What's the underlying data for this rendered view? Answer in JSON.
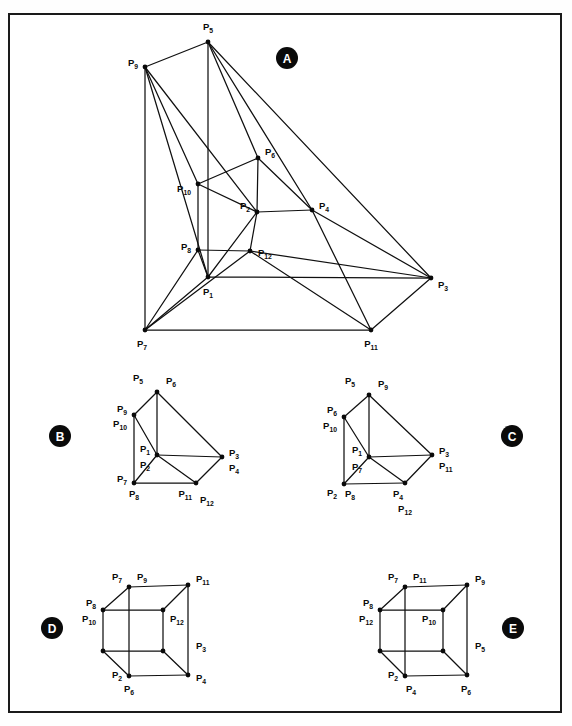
{
  "figure": {
    "title": "",
    "border_color": "#1a1a1a",
    "line_color": "#101010",
    "node_color": "#0a0a0a",
    "panel_badge_bg": "#0a0a0a",
    "panel_badge_fg": "#ffffff"
  },
  "panels": [
    {
      "id": "A",
      "label": "A",
      "cx": 287,
      "cy": 58,
      "r": 11
    },
    {
      "id": "B",
      "label": "B",
      "cx": 60,
      "cy": 436,
      "r": 11
    },
    {
      "id": "C",
      "label": "C",
      "cx": 512,
      "cy": 436,
      "r": 11
    },
    {
      "id": "D",
      "label": "D",
      "cx": 52,
      "cy": 628,
      "r": 11
    },
    {
      "id": "E",
      "label": "E",
      "cx": 513,
      "cy": 628,
      "r": 11
    }
  ],
  "vertex_prefix": "P",
  "panel_a": {
    "nodes": [
      {
        "id": "P1",
        "sub": "1",
        "x": 208,
        "y": 277,
        "lx": 208,
        "ly": 295,
        "anchor": "middle"
      },
      {
        "id": "P2",
        "sub": "2",
        "x": 257,
        "y": 212,
        "lx": 250,
        "ly": 209,
        "anchor": "end"
      },
      {
        "id": "P3",
        "sub": "3",
        "x": 431,
        "y": 278,
        "lx": 438,
        "ly": 288,
        "anchor": "start"
      },
      {
        "id": "P4",
        "sub": "4",
        "x": 312,
        "y": 210,
        "lx": 319,
        "ly": 209,
        "anchor": "start"
      },
      {
        "id": "P5",
        "sub": "5",
        "x": 208,
        "y": 42,
        "lx": 208,
        "ly": 30,
        "anchor": "middle"
      },
      {
        "id": "P6",
        "sub": "6",
        "x": 258,
        "y": 158,
        "lx": 265,
        "ly": 155,
        "anchor": "start"
      },
      {
        "id": "P7",
        "sub": "7",
        "x": 145,
        "y": 330,
        "lx": 142,
        "ly": 347,
        "anchor": "middle"
      },
      {
        "id": "P8",
        "sub": "8",
        "x": 198,
        "y": 250,
        "lx": 191,
        "ly": 250,
        "anchor": "end"
      },
      {
        "id": "P9",
        "sub": "9",
        "x": 145,
        "y": 67,
        "lx": 138,
        "ly": 66,
        "anchor": "end"
      },
      {
        "id": "P10",
        "sub": "10",
        "x": 198,
        "y": 184,
        "lx": 191,
        "ly": 192,
        "anchor": "end"
      },
      {
        "id": "P11",
        "sub": "11",
        "x": 371,
        "y": 330,
        "lx": 371,
        "ly": 347,
        "anchor": "middle"
      },
      {
        "id": "P12",
        "sub": "12",
        "x": 250,
        "y": 251,
        "lx": 258,
        "ly": 256,
        "anchor": "start"
      }
    ],
    "edges": [
      [
        "P5",
        "P9"
      ],
      [
        "P5",
        "P1"
      ],
      [
        "P5",
        "P6"
      ],
      [
        "P5",
        "P4"
      ],
      [
        "P5",
        "P3"
      ],
      [
        "P9",
        "P7"
      ],
      [
        "P9",
        "P10"
      ],
      [
        "P9",
        "P2"
      ],
      [
        "P9",
        "P1"
      ],
      [
        "P10",
        "P6"
      ],
      [
        "P10",
        "P8"
      ],
      [
        "P10",
        "P2"
      ],
      [
        "P6",
        "P2"
      ],
      [
        "P6",
        "P4"
      ],
      [
        "P2",
        "P4"
      ],
      [
        "P2",
        "P12"
      ],
      [
        "P2",
        "P1"
      ],
      [
        "P8",
        "P12"
      ],
      [
        "P8",
        "P7"
      ],
      [
        "P8",
        "P1"
      ],
      [
        "P1",
        "P3"
      ],
      [
        "P1",
        "P7"
      ],
      [
        "P12",
        "P3"
      ],
      [
        "P12",
        "P11"
      ],
      [
        "P4",
        "P3"
      ],
      [
        "P4",
        "P11"
      ],
      [
        "P7",
        "P11"
      ],
      [
        "P7",
        "P12"
      ],
      [
        "P11",
        "P3"
      ]
    ]
  },
  "panel_b": {
    "nodes": [
      {
        "x": 157,
        "y": 392,
        "labels": [
          {
            "t": "P",
            "s": "5",
            "lx": 143,
            "ly": 381,
            "anchor": "end"
          },
          {
            "t": "P",
            "s": "6",
            "lx": 166,
            "ly": 384,
            "anchor": "start"
          }
        ]
      },
      {
        "x": 134,
        "y": 415,
        "labels": [
          {
            "t": "P",
            "s": "9",
            "lx": 127,
            "ly": 412,
            "anchor": "end"
          },
          {
            "t": "P",
            "s": "10",
            "lx": 127,
            "ly": 427,
            "anchor": "end"
          }
        ]
      },
      {
        "x": 157,
        "y": 455,
        "labels": [
          {
            "t": "P",
            "s": "1",
            "lx": 150,
            "ly": 452,
            "anchor": "end"
          },
          {
            "t": "P",
            "s": "2",
            "lx": 150,
            "ly": 468,
            "anchor": "end"
          }
        ]
      },
      {
        "x": 222,
        "y": 457,
        "labels": [
          {
            "t": "P",
            "s": "3",
            "lx": 229,
            "ly": 456,
            "anchor": "start"
          },
          {
            "t": "P",
            "s": "4",
            "lx": 229,
            "ly": 471,
            "anchor": "start"
          }
        ]
      },
      {
        "x": 134,
        "y": 483,
        "labels": [
          {
            "t": "P",
            "s": "7",
            "lx": 127,
            "ly": 482,
            "anchor": "end"
          },
          {
            "t": "P",
            "s": "8",
            "lx": 134,
            "ly": 497,
            "anchor": "middle"
          }
        ]
      },
      {
        "x": 196,
        "y": 483,
        "labels": [
          {
            "t": "P",
            "s": "11",
            "lx": 192,
            "ly": 497,
            "anchor": "end"
          },
          {
            "t": "P",
            "s": "12",
            "lx": 200,
            "ly": 503,
            "anchor": "start"
          }
        ]
      }
    ],
    "edges": [
      [
        0,
        1
      ],
      [
        0,
        2
      ],
      [
        0,
        3
      ],
      [
        1,
        2
      ],
      [
        1,
        4
      ],
      [
        2,
        3
      ],
      [
        2,
        4
      ],
      [
        2,
        5
      ],
      [
        3,
        5
      ],
      [
        4,
        5
      ]
    ]
  },
  "panel_c": {
    "nodes": [
      {
        "x": 369,
        "y": 395,
        "labels": [
          {
            "t": "P",
            "s": "5",
            "lx": 355,
            "ly": 384,
            "anchor": "end"
          },
          {
            "t": "P",
            "s": "9",
            "lx": 378,
            "ly": 387,
            "anchor": "start"
          }
        ]
      },
      {
        "x": 344,
        "y": 417,
        "labels": [
          {
            "t": "P",
            "s": "6",
            "lx": 337,
            "ly": 413,
            "anchor": "end"
          },
          {
            "t": "P",
            "s": "10",
            "lx": 337,
            "ly": 429,
            "anchor": "end"
          }
        ]
      },
      {
        "x": 369,
        "y": 457,
        "labels": [
          {
            "t": "P",
            "s": "1",
            "lx": 362,
            "ly": 453,
            "anchor": "end"
          },
          {
            "t": "P",
            "s": "7",
            "lx": 362,
            "ly": 470,
            "anchor": "end"
          }
        ]
      },
      {
        "x": 432,
        "y": 455,
        "labels": [
          {
            "t": "P",
            "s": "3",
            "lx": 439,
            "ly": 454,
            "anchor": "start"
          },
          {
            "t": "P",
            "s": "11",
            "lx": 439,
            "ly": 469,
            "anchor": "start"
          }
        ]
      },
      {
        "x": 344,
        "y": 484,
        "labels": [
          {
            "t": "P",
            "s": "2",
            "lx": 337,
            "ly": 496,
            "anchor": "end"
          },
          {
            "t": "P",
            "s": "8",
            "lx": 345,
            "ly": 497,
            "anchor": "start"
          }
        ]
      },
      {
        "x": 405,
        "y": 483,
        "labels": [
          {
            "t": "P",
            "s": "4",
            "lx": 403,
            "ly": 497,
            "anchor": "end"
          },
          {
            "t": "P",
            "s": "12",
            "lx": 405,
            "ly": 512,
            "anchor": "middle"
          }
        ]
      }
    ],
    "edges": [
      [
        0,
        1
      ],
      [
        0,
        2
      ],
      [
        0,
        3
      ],
      [
        1,
        2
      ],
      [
        1,
        4
      ],
      [
        2,
        3
      ],
      [
        2,
        4
      ],
      [
        2,
        5
      ],
      [
        3,
        5
      ],
      [
        4,
        5
      ]
    ]
  },
  "panel_d": {
    "nodes": [
      {
        "x": 129,
        "y": 587,
        "labels": [
          {
            "t": "P",
            "s": "7",
            "lx": 122,
            "ly": 580,
            "anchor": "end"
          },
          {
            "t": "P",
            "s": "9",
            "lx": 137,
            "ly": 580,
            "anchor": "start"
          }
        ]
      },
      {
        "x": 188,
        "y": 585,
        "labels": [
          {
            "t": "P",
            "s": "11",
            "lx": 196,
            "ly": 582,
            "anchor": "start"
          }
        ]
      },
      {
        "x": 103,
        "y": 610,
        "labels": [
          {
            "t": "P",
            "s": "8",
            "lx": 96,
            "ly": 606,
            "anchor": "end"
          },
          {
            "t": "P",
            "s": "10",
            "lx": 96,
            "ly": 622,
            "anchor": "end"
          }
        ]
      },
      {
        "x": 163,
        "y": 610,
        "labels": [
          {
            "t": "P",
            "s": "12",
            "lx": 170,
            "ly": 622,
            "anchor": "start"
          }
        ]
      },
      {
        "x": 103,
        "y": 651,
        "labels": []
      },
      {
        "x": 163,
        "y": 651,
        "labels": []
      },
      {
        "x": 129,
        "y": 676,
        "labels": [
          {
            "t": "P",
            "s": "2",
            "lx": 122,
            "ly": 678,
            "anchor": "end"
          },
          {
            "t": "P",
            "s": "6",
            "lx": 129,
            "ly": 692,
            "anchor": "middle"
          }
        ]
      },
      {
        "x": 188,
        "y": 675,
        "labels": [
          {
            "t": "P",
            "s": "4",
            "lx": 196,
            "ly": 681,
            "anchor": "start"
          }
        ]
      }
    ],
    "edges": [
      [
        0,
        1
      ],
      [
        0,
        2
      ],
      [
        0,
        6
      ],
      [
        1,
        3
      ],
      [
        1,
        7
      ],
      [
        2,
        3
      ],
      [
        2,
        4
      ],
      [
        3,
        5
      ],
      [
        4,
        5
      ],
      [
        4,
        6
      ],
      [
        5,
        7
      ],
      [
        6,
        7
      ]
    ],
    "right_label": {
      "t": "P",
      "s": "3",
      "lx": 196,
      "ly": 649,
      "anchor": "start"
    }
  },
  "panel_e": {
    "nodes": [
      {
        "x": 405,
        "y": 587,
        "labels": [
          {
            "t": "P",
            "s": "7",
            "lx": 398,
            "ly": 580,
            "anchor": "end"
          },
          {
            "t": "P",
            "s": "11",
            "lx": 413,
            "ly": 580,
            "anchor": "start"
          }
        ]
      },
      {
        "x": 467,
        "y": 585,
        "labels": [
          {
            "t": "P",
            "s": "9",
            "lx": 475,
            "ly": 582,
            "anchor": "start"
          }
        ]
      },
      {
        "x": 380,
        "y": 610,
        "labels": [
          {
            "t": "P",
            "s": "8",
            "lx": 373,
            "ly": 606,
            "anchor": "end"
          },
          {
            "t": "P",
            "s": "12",
            "lx": 373,
            "ly": 622,
            "anchor": "end"
          }
        ]
      },
      {
        "x": 443,
        "y": 610,
        "labels": [
          {
            "t": "P",
            "s": "10",
            "lx": 436,
            "ly": 622,
            "anchor": "end"
          }
        ]
      },
      {
        "x": 380,
        "y": 651,
        "labels": []
      },
      {
        "x": 443,
        "y": 651,
        "labels": []
      },
      {
        "x": 405,
        "y": 676,
        "labels": [
          {
            "t": "P",
            "s": "2",
            "lx": 398,
            "ly": 678,
            "anchor": "end"
          },
          {
            "t": "P",
            "s": "4",
            "lx": 406,
            "ly": 692,
            "anchor": "start"
          }
        ]
      },
      {
        "x": 467,
        "y": 675,
        "labels": [
          {
            "t": "P",
            "s": "6",
            "lx": 466,
            "ly": 692,
            "anchor": "middle"
          }
        ]
      }
    ],
    "edges": [
      [
        0,
        1
      ],
      [
        0,
        2
      ],
      [
        0,
        6
      ],
      [
        1,
        3
      ],
      [
        1,
        7
      ],
      [
        2,
        3
      ],
      [
        2,
        4
      ],
      [
        3,
        5
      ],
      [
        4,
        5
      ],
      [
        4,
        6
      ],
      [
        5,
        7
      ],
      [
        6,
        7
      ]
    ],
    "right_label": {
      "t": "P",
      "s": "5",
      "lx": 475,
      "ly": 649,
      "anchor": "start"
    }
  }
}
